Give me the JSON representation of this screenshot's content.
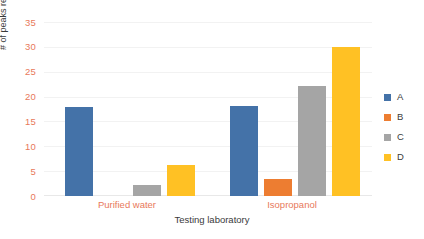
{
  "chart_data": {
    "type": "bar",
    "title": "",
    "subtitle": "",
    "xlabel": "Testing laboratory",
    "ylabel": "# of peaks reported",
    "categories": [
      "Purified water",
      "Isopropanol"
    ],
    "series": [
      {
        "name": "A",
        "color": "#4472A8",
        "values": [
          18.0,
          18.3
        ]
      },
      {
        "name": "B",
        "color": "#ED7D31",
        "values": [
          0,
          3.4
        ]
      },
      {
        "name": "C",
        "color": "#A5A5A5",
        "values": [
          2.2,
          22.3
        ]
      },
      {
        "name": "D",
        "color": "#FFC124",
        "values": [
          6.2,
          30.2
        ]
      }
    ],
    "ylim": [
      0,
      35
    ],
    "yticks": [
      0,
      5,
      10,
      15,
      20,
      25,
      30,
      35
    ],
    "ytick_labels": [
      "0",
      "5",
      "10",
      "15",
      "20",
      "25",
      "30",
      "35"
    ],
    "grid": true,
    "grid_axis": "y",
    "legend_position": "right",
    "legend_entries": [
      "A",
      "B",
      "C",
      "D"
    ],
    "axis_label_color": "#E8795A",
    "axis_title_color": "#3A3A3A",
    "gridline_color": "#F2F2F2",
    "background": "#FFFFFF"
  }
}
